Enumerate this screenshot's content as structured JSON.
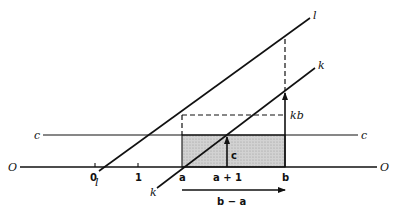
{
  "figure": {
    "type": "geometric-diagram"
  },
  "labels": {
    "axis_left": "O",
    "axis_right": "O",
    "c_left": "c",
    "c_right": "c",
    "l_top": "l",
    "l_bottom": "l",
    "k_top": "k",
    "k_bottom": "k",
    "tick_0": "0",
    "tick_1": "1",
    "tick_a": "a",
    "tick_a_plus_1": "a + 1",
    "tick_b": "b",
    "arrow_c": "c",
    "arrow_kb": "kb",
    "arrow_b_minus_a": "b − a"
  },
  "colors": {
    "ink": "#111111",
    "shade": "#c8c8c8",
    "background": "#ffffff"
  }
}
